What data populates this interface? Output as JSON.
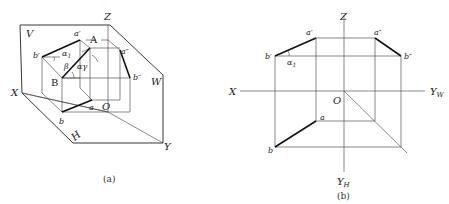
{
  "figure_a": {
    "caption": "(a)",
    "planes": {
      "V": "V",
      "W": "W",
      "H": "H"
    },
    "axes": {
      "X": "X",
      "Y": "Y",
      "Z": "Z",
      "O": "O"
    },
    "points": {
      "A": "A",
      "B": "B",
      "a_prime": "a′",
      "b_prime": "b′",
      "a_dprime": "a″",
      "b_dprime": "b″",
      "a": "a",
      "b": "b"
    },
    "angles": {
      "alpha1": "α",
      "alpha1_sub": "1",
      "beta": "β",
      "alpha_gamma": "αγ"
    }
  },
  "figure_b": {
    "caption": "(b)",
    "axes": {
      "X": "X",
      "Z": "Z",
      "O": "O",
      "Yw": "Y",
      "Yw_sub": "W",
      "Yh": "Y",
      "Yh_sub": "H"
    },
    "points": {
      "a_prime": "a′",
      "b_prime": "b′",
      "a_dprime": "a″",
      "b_dprime": "b″",
      "a": "a",
      "b": "b"
    },
    "angles": {
      "alpha1": "α",
      "alpha1_sub": "1"
    }
  }
}
